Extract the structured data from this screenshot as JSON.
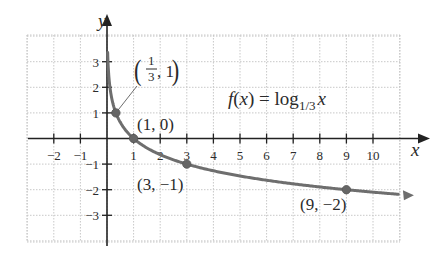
{
  "chart_data": {
    "type": "line",
    "title": "",
    "function_label": "f(x) = log_{1/3} x",
    "function_label_parts": {
      "lhs": "f(x) = log",
      "base": "1/3",
      "arg": "x"
    },
    "xlabel": "x",
    "ylabel": "y",
    "xlim": [
      -3,
      11.3
    ],
    "ylim": [
      -4.2,
      4.3
    ],
    "grid": true,
    "grid_style": "dotted",
    "x_ticks": [
      -2,
      -1,
      1,
      2,
      3,
      4,
      5,
      6,
      7,
      8,
      9,
      10
    ],
    "y_ticks": [
      3,
      2,
      1,
      -1,
      -2,
      -3
    ],
    "x_tick_labels": [
      "−2",
      "−1",
      "1",
      "2",
      "3",
      "4",
      "5",
      "6",
      "7",
      "8",
      "9",
      "10"
    ],
    "y_tick_labels": [
      "3",
      "2",
      "1",
      "−1",
      "−2",
      "−3"
    ],
    "series": [
      {
        "name": "f(x) = log_{1/3} x",
        "color": "#6e6e6e",
        "x": [
          0.02,
          0.05,
          0.1,
          0.2,
          0.333,
          0.5,
          1,
          2,
          3,
          5,
          7,
          9,
          11
        ],
        "y": [
          3.56,
          2.73,
          2.1,
          1.46,
          1,
          0.63,
          0,
          -0.63,
          -1,
          -1.46,
          -1.77,
          -2,
          -2.18
        ]
      }
    ],
    "highlighted_points": [
      {
        "x": 0.3333,
        "y": 1,
        "label_num": "1",
        "label_den": "3",
        "label_rest": ", 1",
        "label": "(1/3, 1)"
      },
      {
        "x": 1,
        "y": 0,
        "label": "(1, 0)"
      },
      {
        "x": 3,
        "y": -1,
        "label": "(3, −1)"
      },
      {
        "x": 9,
        "y": -2,
        "label": "(9, −2)"
      }
    ]
  },
  "colors": {
    "axis": "#222222",
    "curve": "#6e6e6e",
    "grid": "#c8c8c8",
    "point": "#666666",
    "text": "#2b2b2b"
  }
}
